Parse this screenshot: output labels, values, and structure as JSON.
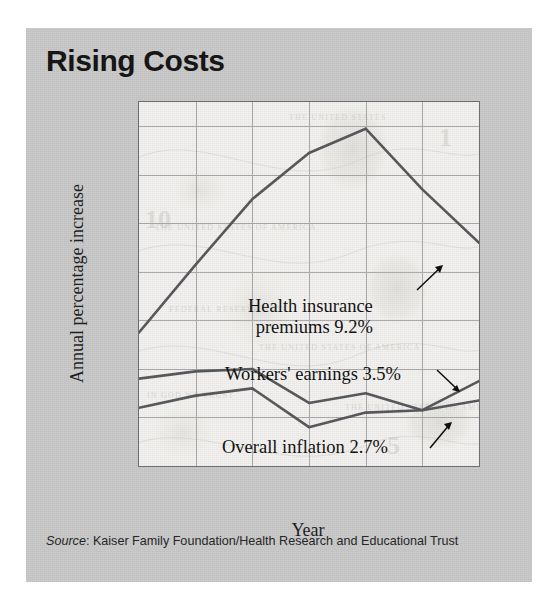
{
  "figure": {
    "title": "Rising Costs",
    "background_color": "#c9c9c9",
    "plot_background_color": "#f2f2f0",
    "line_color": "#55565a",
    "grid_color": "#a9a9a9"
  },
  "source": {
    "prefix": "Source",
    "separator": ": ",
    "text": "Kaiser Family Foundation/Health Research and Educational Trust"
  },
  "annotations": {
    "health": {
      "line1": "Health insurance",
      "line2": "premiums 9.2%"
    },
    "workers": {
      "line1": "Workers' earnings 3.5%"
    },
    "inflation": {
      "line1": "Overall inflation 2.7%"
    }
  },
  "chart_data": {
    "type": "line",
    "title": "Rising Costs",
    "subtitle": "",
    "xlabel": "Year",
    "ylabel": "Annual percentage increase",
    "x": [
      1999,
      2000,
      2001,
      2002,
      2003,
      2004,
      2005
    ],
    "categories": [
      "1999",
      "2000",
      "2001",
      "2002",
      "2003",
      "2004",
      "2005"
    ],
    "xtick_labels": [
      "1999",
      "2000",
      "2001",
      "2002",
      "2003",
      "2004",
      "2005"
    ],
    "ytick_labels": [
      "0",
      "2",
      "4",
      "6",
      "8",
      "10",
      "12",
      "14%"
    ],
    "ytick_values": [
      0,
      2,
      4,
      6,
      8,
      10,
      12,
      14
    ],
    "ylim": [
      0,
      15
    ],
    "xlim": [
      1999,
      2005
    ],
    "grid": true,
    "legend": "none (inline annotations)",
    "series": [
      {
        "name": "Health insurance premiums",
        "values": [
          5.5,
          8.3,
          11.0,
          12.9,
          13.9,
          11.4,
          9.2
        ],
        "end_label": "9.2%"
      },
      {
        "name": "Workers' earnings",
        "values": [
          3.6,
          3.9,
          4.0,
          2.6,
          3.0,
          2.3,
          3.5
        ],
        "end_label": "3.5%"
      },
      {
        "name": "Overall inflation",
        "values": [
          2.4,
          2.9,
          3.2,
          1.6,
          2.2,
          2.3,
          2.7
        ],
        "end_label": "2.7%"
      }
    ]
  }
}
